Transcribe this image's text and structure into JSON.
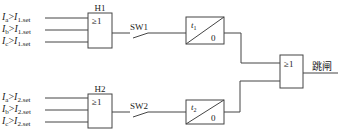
{
  "diagram": {
    "type": "logic-diagram",
    "upper": {
      "inputs": [
        {
          "phase": "a",
          "stage": "1"
        },
        {
          "phase": "b",
          "stage": "1"
        },
        {
          "phase": "c",
          "stage": "1"
        }
      ],
      "gate_name": "H1",
      "gate_symbol": "≥1",
      "switch_label": "SW1",
      "timer": {
        "delay": "t",
        "delay_sub": "1",
        "return": "0"
      }
    },
    "lower": {
      "inputs": [
        {
          "phase": "a",
          "stage": "2"
        },
        {
          "phase": "b",
          "stage": "2"
        },
        {
          "phase": "c",
          "stage": "2"
        }
      ],
      "gate_name": "H2",
      "gate_symbol": "≥1",
      "switch_label": "SW2",
      "timer": {
        "delay": "t",
        "delay_sub": "2",
        "return": "0"
      }
    },
    "output_gate_symbol": "≥1",
    "output_label": "跳闸",
    "input_text": {
      "I": "I",
      "gt": ">",
      "set": "set"
    }
  }
}
